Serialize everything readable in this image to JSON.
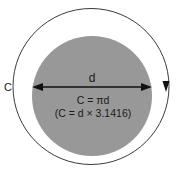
{
  "diagram": {
    "background_color": "#ffffff",
    "outer_circle": {
      "name": "circumference-circle",
      "stroke_color": "#3a3a3a",
      "fill_color": "#ffffff",
      "center_x": 91,
      "center_y": 86.5,
      "radius": 78
    },
    "inner_circle": {
      "name": "shaded-disc",
      "fill_color": "#989898",
      "stroke_color": "none",
      "center_x": 92,
      "center_y": 96,
      "radius": 60
    },
    "labels": {
      "circumference": "C",
      "diameter": "d",
      "formula_line1": "C = πd",
      "formula_line2": "(C = d × 3.1416)"
    },
    "diameter_arrow": {
      "name": "diameter-arrow",
      "x_start": 32,
      "x_end": 152,
      "y": 87,
      "color": "#111111",
      "double_headed": true
    },
    "circumference_marker": {
      "name": "circumference-arrowhead",
      "x": 166,
      "y": 86,
      "direction": "down",
      "color": "#111111"
    },
    "text_color": "#1a1a1a"
  }
}
